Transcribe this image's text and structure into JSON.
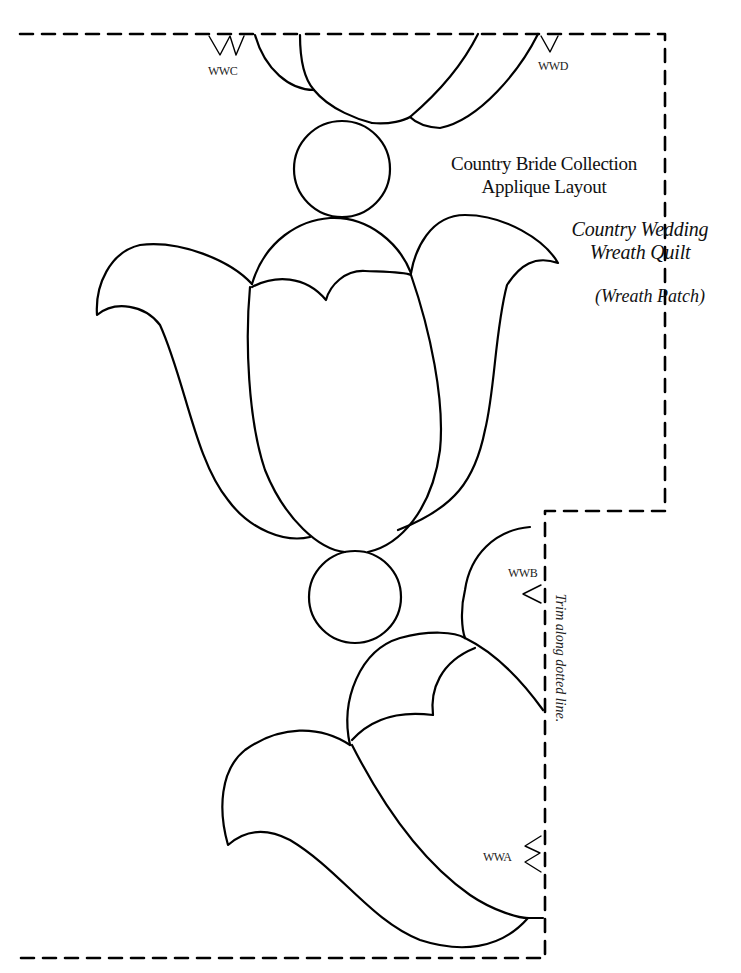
{
  "document": {
    "heading_line1": "Country Bride Collection",
    "heading_line2": "Applique Layout",
    "pattern_name_line1": "Country Wedding",
    "pattern_name_line2": "Wreath Quilt",
    "patch_name": "(Wreath Patch)",
    "trim_instruction": "Trim along dotted line."
  },
  "alignment_markers": [
    {
      "id": "WWC",
      "label": "WWC",
      "glyph": "double-triangle-down"
    },
    {
      "id": "WWD",
      "label": "WWD",
      "glyph": "single-triangle-down"
    },
    {
      "id": "WWB",
      "label": "WWB",
      "glyph": "single-triangle-left"
    },
    {
      "id": "WWA",
      "label": "WWA",
      "glyph": "double-triangle-left"
    }
  ],
  "colors": {
    "line": "#000000",
    "background": "#ffffff",
    "text": "#111111"
  }
}
